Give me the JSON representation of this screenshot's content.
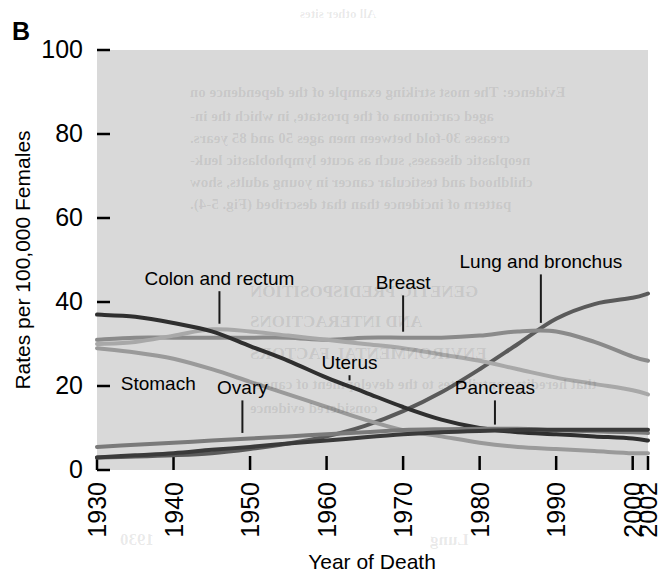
{
  "figure": {
    "panel_label": "B",
    "background_color": "#ffffff",
    "plot_background_color": "#d9d9d9"
  },
  "chart_data": {
    "type": "line",
    "title": "",
    "subtitle": "",
    "xlabel": "Year of Death",
    "ylabel": "Rates per 100,000 Females",
    "xlim": [
      1930,
      2002
    ],
    "ylim": [
      0,
      100
    ],
    "grid": false,
    "legend_position": "inline-annotations",
    "xticks": [
      1930,
      1940,
      1950,
      1960,
      1970,
      1980,
      1990,
      2000,
      2002
    ],
    "xtick_labels": [
      "1930",
      "1940",
      "1950",
      "1960",
      "1970",
      "1980",
      "1990",
      "2000",
      "2002"
    ],
    "yticks": [
      0,
      20,
      40,
      60,
      80,
      100
    ],
    "ytick_labels": [
      "0",
      "20",
      "40",
      "60",
      "80",
      "100"
    ],
    "x": [
      1930,
      1935,
      1940,
      1945,
      1950,
      1955,
      1960,
      1965,
      1970,
      1975,
      1980,
      1985,
      1990,
      1995,
      2000,
      2002
    ],
    "series": [
      {
        "name": "Lung and bronchus",
        "color": "#5a5a5a",
        "label_x": 1988,
        "label_y": 48,
        "values": [
          3.0,
          3.2,
          3.5,
          4.0,
          5.0,
          6.3,
          8.0,
          10.5,
          14.0,
          18.5,
          24.0,
          30.0,
          36.0,
          39.5,
          41.0,
          42.0
        ]
      },
      {
        "name": "Breast",
        "color": "#8a8a8a",
        "label_x": 1970,
        "label_y": 43,
        "values": [
          31.0,
          31.5,
          31.5,
          31.5,
          31.5,
          31.5,
          31.0,
          31.5,
          31.5,
          31.5,
          32.0,
          33.0,
          33.0,
          30.5,
          27.0,
          26.0
        ]
      },
      {
        "name": "Colon and rectum",
        "color": "#a8a8a8",
        "label_x": 1946,
        "label_y": 44,
        "values": [
          30.0,
          30.5,
          32.0,
          33.5,
          33.0,
          32.0,
          31.0,
          30.0,
          29.0,
          27.5,
          26.0,
          24.0,
          22.0,
          20.5,
          19.0,
          18.0
        ]
      },
      {
        "name": "Uterus",
        "color": "#2f2f2f",
        "label_x": 1963,
        "label_y": 24,
        "values": [
          37.0,
          36.5,
          35.0,
          33.0,
          29.5,
          26.0,
          22.0,
          18.5,
          15.0,
          12.0,
          10.0,
          9.0,
          8.5,
          8.0,
          7.5,
          7.0
        ]
      },
      {
        "name": "Stomach",
        "color": "#9a9a9a",
        "label_x": 1938,
        "label_y": 19,
        "values": [
          29.0,
          28.0,
          26.5,
          24.0,
          21.0,
          18.0,
          15.0,
          12.0,
          9.5,
          8.0,
          6.5,
          5.5,
          5.0,
          4.5,
          4.0,
          4.0
        ]
      },
      {
        "name": "Ovary",
        "color": "#7a7a7a",
        "label_x": 1949,
        "label_y": 18,
        "values": [
          5.5,
          6.0,
          6.5,
          7.0,
          7.5,
          8.0,
          8.5,
          9.0,
          9.5,
          9.7,
          9.8,
          9.8,
          9.5,
          9.2,
          9.0,
          8.8
        ]
      },
      {
        "name": "Pancreas",
        "color": "#3a3a3a",
        "label_x": 1982,
        "label_y": 18,
        "values": [
          3.0,
          3.5,
          4.0,
          4.8,
          5.5,
          6.3,
          7.0,
          7.8,
          8.5,
          9.0,
          9.3,
          9.5,
          9.6,
          9.6,
          9.6,
          9.6
        ]
      }
    ]
  }
}
